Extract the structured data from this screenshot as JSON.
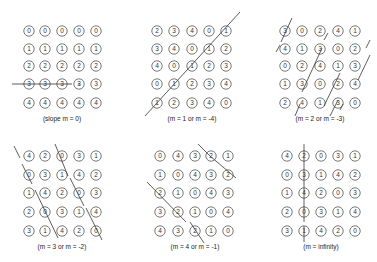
{
  "figure": {
    "background": "#ffffff",
    "circle_stroke": "#555555",
    "text_color": "#333333",
    "line_color": "#333333",
    "panels": [
      {
        "id": "slope-0",
        "caption": "(slope m = 0)",
        "caption_x": 62,
        "caption_y": 120,
        "cols_x": [
          29,
          45,
          62,
          79,
          96
        ],
        "rows_y": [
          31,
          49,
          66,
          84,
          103
        ],
        "grid": [
          [
            0,
            0,
            0,
            0,
            0
          ],
          [
            1,
            1,
            1,
            1,
            1
          ],
          [
            2,
            2,
            2,
            2,
            2
          ],
          [
            3,
            3,
            3,
            3,
            3
          ],
          [
            4,
            4,
            4,
            4,
            4
          ]
        ],
        "lines": [
          [
            12,
            84,
            112,
            84
          ]
        ]
      },
      {
        "id": "slope-1",
        "caption": "(m = 1  or  m = -4)",
        "caption_x": 192,
        "caption_y": 120,
        "cols_x": [
          157,
          174,
          192,
          209,
          226
        ],
        "rows_y": [
          31,
          49,
          66,
          84,
          103
        ],
        "grid": [
          [
            2,
            3,
            4,
            0,
            1
          ],
          [
            3,
            4,
            0,
            1,
            2
          ],
          [
            4,
            0,
            1,
            2,
            3
          ],
          [
            0,
            1,
            2,
            3,
            4
          ],
          [
            1,
            2,
            3,
            4,
            0
          ]
        ],
        "lines": [
          [
            145,
            116,
            240,
            12
          ]
        ]
      },
      {
        "id": "slope-2",
        "caption": "(m = 2  or  m = -3)",
        "caption_x": 320,
        "caption_y": 120,
        "cols_x": [
          285,
          302,
          320,
          338,
          355
        ],
        "rows_y": [
          31,
          49,
          66,
          84,
          103
        ],
        "grid": [
          [
            3,
            0,
            2,
            4,
            1
          ],
          [
            4,
            1,
            3,
            0,
            2
          ],
          [
            0,
            2,
            4,
            1,
            3
          ],
          [
            1,
            3,
            0,
            2,
            4
          ],
          [
            2,
            4,
            1,
            3,
            0
          ]
        ],
        "lines": [
          [
            281,
            42,
            292,
            18
          ],
          [
            276,
            52,
            280,
            45
          ],
          [
            295,
            116,
            300,
            104
          ],
          [
            302,
            92,
            322,
            48
          ],
          [
            324,
            40,
            328,
            33
          ],
          [
            324,
            106,
            340,
            73
          ],
          [
            340,
            110,
            343,
            104
          ],
          [
            358,
            80,
            370,
            55
          ],
          [
            366,
            48,
            370,
            40
          ],
          [
            330,
            116,
            338,
            100
          ]
        ]
      },
      {
        "id": "slope-3",
        "caption": "(m = 3  or  m = -2)",
        "caption_x": 62,
        "caption_y": 248,
        "cols_x": [
          29,
          45,
          62,
          79,
          96
        ],
        "rows_y": [
          156,
          175,
          193,
          212,
          231
        ],
        "grid": [
          [
            4,
            2,
            0,
            3,
            1
          ],
          [
            0,
            3,
            1,
            4,
            2
          ],
          [
            1,
            4,
            2,
            0,
            3
          ],
          [
            2,
            0,
            3,
            1,
            4
          ],
          [
            3,
            1,
            4,
            2,
            0
          ]
        ],
        "lines": [
          [
            14,
            146,
            20,
            158
          ],
          [
            22,
            164,
            32,
            184
          ],
          [
            35,
            190,
            58,
            238
          ],
          [
            55,
            144,
            68,
            176
          ],
          [
            70,
            178,
            84,
            206
          ],
          [
            86,
            208,
            102,
            240
          ]
        ]
      },
      {
        "id": "slope-4",
        "caption": "(m = 4  or  m = -1)",
        "caption_x": 195,
        "caption_y": 248,
        "cols_x": [
          160,
          178,
          195,
          211,
          228
        ],
        "rows_y": [
          156,
          175,
          193,
          212,
          231
        ],
        "grid": [
          [
            0,
            4,
            3,
            2,
            1
          ],
          [
            1,
            0,
            4,
            3,
            2
          ],
          [
            2,
            1,
            0,
            4,
            3
          ],
          [
            3,
            2,
            1,
            0,
            4
          ],
          [
            4,
            3,
            2,
            1,
            0
          ]
        ],
        "lines": [
          [
            198,
            144,
            210,
            156
          ],
          [
            210,
            156,
            236,
            178
          ],
          [
            147,
            182,
            186,
            222
          ],
          [
            190,
            222,
            204,
            243
          ]
        ]
      },
      {
        "id": "slope-inf",
        "caption": "(m = infinity)",
        "caption_x": 321,
        "caption_y": 248,
        "cols_x": [
          287,
          304,
          321,
          338,
          355
        ],
        "rows_y": [
          156,
          175,
          193,
          212,
          231
        ],
        "grid": [
          [
            4,
            2,
            0,
            3,
            1
          ],
          [
            0,
            3,
            1,
            4,
            2
          ],
          [
            1,
            4,
            2,
            0,
            3
          ],
          [
            2,
            0,
            3,
            1,
            4
          ],
          [
            3,
            1,
            4,
            2,
            0
          ]
        ],
        "lines": [
          [
            304,
            144,
            304,
            222
          ],
          [
            304,
            226,
            304,
            242
          ]
        ]
      }
    ]
  }
}
